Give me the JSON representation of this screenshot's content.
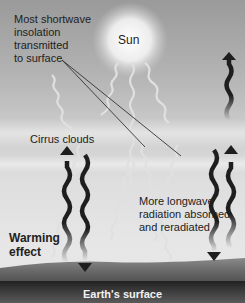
{
  "diagram": {
    "labels": {
      "sun": "Sun",
      "insolation": "Most shortwave insolation transmitted to surface",
      "insolation_lines": [
        "Most shortwave",
        "insolation",
        "transmitted",
        "to surface"
      ],
      "cirrus": "Cirrus clouds",
      "longwave_lines": [
        "More longwave",
        "radiation absorbed",
        "and reradiated"
      ],
      "warming_lines": [
        "Warming",
        "effect"
      ],
      "surface": "Earth's surface"
    },
    "colors": {
      "sky_top": "#9a9a9a",
      "sky_bottom": "#e8e8e8",
      "sun_glow": "#ffffff",
      "shortwave": "#d8d8d8",
      "longwave_arrow": "#1e1e1e",
      "ground": "#6e6e6e",
      "surface_band": "#3a3a3a",
      "leader_line": "#333333"
    }
  }
}
